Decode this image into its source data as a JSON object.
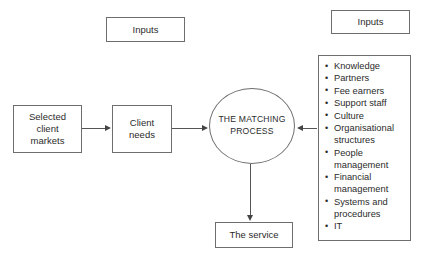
{
  "diagram": {
    "title": "The matching process",
    "inputs_left_label": "Inputs",
    "inputs_right_label": "Inputs",
    "selected_client_markets": "Selected\nclient\nmarkets",
    "selected_client_markets_lines": [
      "Selected",
      "client",
      "markets"
    ],
    "client_needs_lines": [
      "Client",
      "needs"
    ],
    "matching_process_lines": [
      "THE",
      "MATCHING",
      "PROCESS"
    ],
    "the_service_label": "The service",
    "resources": [
      "Knowledge",
      "Partners",
      "Fee earners",
      "Support staff",
      "Culture",
      "Organisational structures",
      "People management",
      "Financial management",
      "Systems and procedures",
      "IT"
    ],
    "colors": {
      "background": "#ffffff",
      "text": "#2b2b2b",
      "border": "#6e6e6e",
      "arrow": "#444444"
    }
  }
}
